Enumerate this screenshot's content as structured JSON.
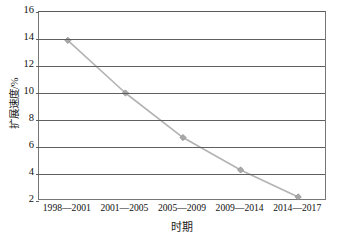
{
  "chart_data": {
    "type": "line",
    "title": "",
    "xlabel": "时期",
    "ylabel": "扩展速度/%",
    "categories": [
      "1998—2001",
      "2001—2005",
      "2005—2009",
      "2009—2014",
      "2014—2017"
    ],
    "values": [
      13.9,
      10.0,
      6.7,
      4.3,
      2.3
    ],
    "series": [
      {
        "name": "扩展速度",
        "values": [
          13.9,
          10.0,
          6.7,
          4.3,
          2.3
        ]
      }
    ],
    "ylim": [
      2,
      16
    ],
    "yticks": [
      2,
      4,
      6,
      8,
      10,
      12,
      14,
      16
    ],
    "ytick_labels": [
      "2",
      "4",
      "6",
      "8",
      "10",
      "12",
      "14",
      "16"
    ],
    "grid": "horizontal",
    "legend": "none",
    "marker": "diamond",
    "line_color": "#b3b3b3",
    "marker_color": "#a8a8a8",
    "marker_edge_color": "#8f8f8f",
    "grid_color": "#5f5f5f",
    "axis_color": "#767676",
    "background": "#ffffff"
  }
}
